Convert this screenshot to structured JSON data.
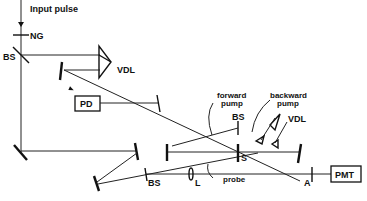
{
  "diagram": {
    "labels": {
      "input_pulse": "Input pulse",
      "ng": "NG",
      "bs_top": "BS",
      "vdl_top": "VDL",
      "pd": "PD",
      "forward_pump_1": "forward",
      "forward_pump_2": "pump",
      "backward_pump_1": "backward",
      "backward_pump_2": "pump",
      "bs_mid": "BS",
      "vdl_right": "VDL",
      "s": "S",
      "bs_bottom": "BS",
      "l": "L",
      "probe": "probe",
      "a": "A",
      "pmt": "PMT"
    }
  }
}
